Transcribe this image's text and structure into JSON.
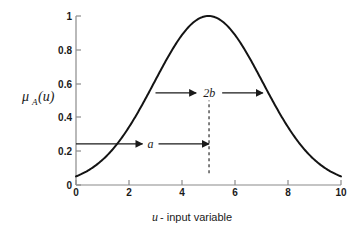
{
  "chart_data": {
    "type": "line",
    "title": "",
    "xlabel": "u - input variable",
    "xlabel_italic_part": "u",
    "xlabel_rest_part": " - input variable",
    "ylabel": "μA(u)",
    "ylabel_symbol": "μ",
    "ylabel_subscript": "A",
    "ylabel_arg": "(u)",
    "xlim": [
      0,
      10
    ],
    "ylim": [
      0,
      1
    ],
    "xticks": [
      0,
      2,
      4,
      6,
      8,
      10
    ],
    "xtick_labels": [
      "0",
      "2",
      "4",
      "6",
      "8",
      "10"
    ],
    "yticks": [
      0,
      0.2,
      0.4,
      0.6,
      0.8,
      1
    ],
    "ytick_labels": [
      "0",
      "0.2",
      "0.4",
      "0.6",
      "0.8",
      "1"
    ],
    "grid": false,
    "legend": "none",
    "curve_color": "#141414",
    "axis_color": "#8a8a8a",
    "function": "gaussian",
    "center": 5,
    "sigma": 2.05,
    "peak": 1,
    "x": [
      0,
      0.25,
      0.5,
      0.75,
      1,
      1.25,
      1.5,
      1.75,
      2,
      2.25,
      2.5,
      2.75,
      3,
      3.25,
      3.5,
      3.75,
      4,
      4.25,
      4.5,
      4.75,
      5,
      5.25,
      5.5,
      5.75,
      6,
      6.25,
      6.5,
      6.75,
      7,
      7.25,
      7.5,
      7.75,
      8,
      8.25,
      8.5,
      8.75,
      9,
      9.25,
      9.5,
      9.75,
      10
    ],
    "y": [
      0.05,
      0.064,
      0.081,
      0.102,
      0.127,
      0.156,
      0.19,
      0.229,
      0.273,
      0.322,
      0.375,
      0.432,
      0.492,
      0.554,
      0.617,
      0.679,
      0.738,
      0.793,
      0.843,
      0.885,
      0.92,
      0.885,
      0.843,
      0.793,
      0.738,
      0.679,
      0.617,
      0.554,
      0.492,
      0.432,
      0.375,
      0.322,
      0.273,
      0.229,
      0.19,
      0.156,
      0.127,
      0.102,
      0.081,
      0.064,
      0.05
    ],
    "annotations": [
      {
        "id": "width-annotation",
        "label": "2b",
        "type": "double-arrow",
        "x_start": 3.0,
        "x_end": 7.05,
        "y": 0.545
      },
      {
        "id": "center-annotation",
        "label": "a",
        "type": "double-arrow",
        "x_start": 0,
        "x_end": 5.02,
        "y": 0.243
      },
      {
        "id": "center-marker",
        "label": "",
        "type": "dashed-vertical",
        "x": 5.02,
        "y_start": 0.07,
        "y_end": 0.5
      }
    ]
  }
}
